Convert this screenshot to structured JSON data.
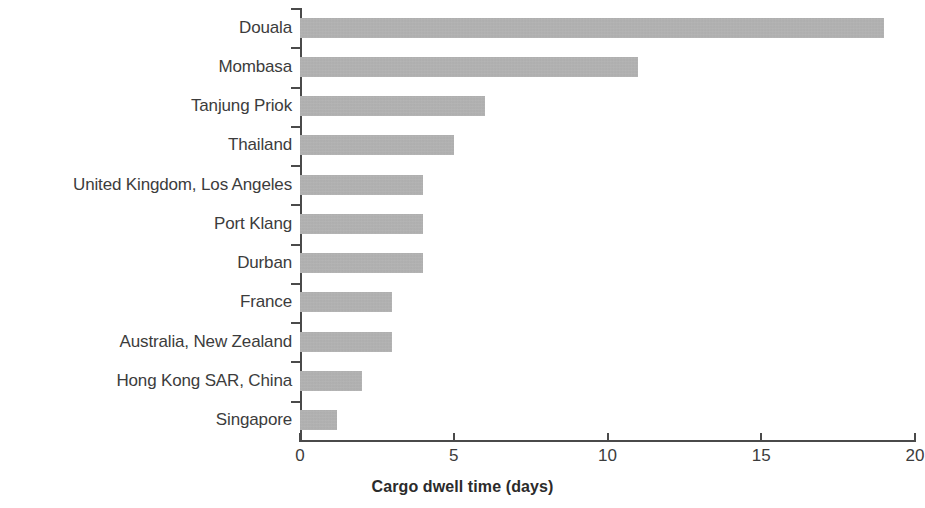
{
  "chart_data": {
    "type": "bar",
    "orientation": "horizontal",
    "title": "",
    "subtitle": "",
    "xlabel": "Cargo dwell time (days)",
    "ylabel": "",
    "xlim": [
      0,
      20
    ],
    "xticks": [
      0,
      5,
      10,
      15,
      20
    ],
    "xtick_labels": [
      "0",
      "5",
      "10",
      "15",
      "20"
    ],
    "grid": false,
    "legend": null,
    "bar_color": "#a6a6a6",
    "axis_color": "#4a4a4a",
    "text_color": "#3c3c3c",
    "categories": [
      "Douala",
      "Mombasa",
      "Tanjung Priok",
      "Thailand",
      "United Kingdom, Los Angeles",
      "Port Klang",
      "Durban",
      "France",
      "Australia, New Zealand",
      "Hong Kong SAR, China",
      "Singapore"
    ],
    "values": [
      19,
      11,
      6,
      5,
      4,
      4,
      4,
      3,
      3,
      2,
      1.2
    ],
    "series": [
      {
        "name": "Cargo dwell time (days)",
        "values": [
          19,
          11,
          6,
          5,
          4,
          4,
          4,
          3,
          3,
          2,
          1.2
        ]
      }
    ]
  }
}
